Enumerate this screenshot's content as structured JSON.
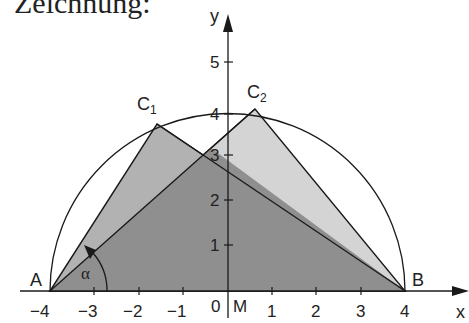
{
  "heading": "Zeichnung:",
  "colors": {
    "dark_fill": "#8c8c8c",
    "mid_fill": "#b4b4b4",
    "light_fill": "#d6d6d6",
    "line": "#1a1a1a",
    "background": "#ffffff"
  },
  "axes": {
    "x_label": "x",
    "y_label": "y",
    "x_ticks": [
      "−4",
      "−3",
      "−2",
      "−1",
      "0",
      "1",
      "2",
      "3",
      "4"
    ],
    "y_ticks": [
      "1",
      "2",
      "3",
      "4",
      "5"
    ],
    "origin_label": "0"
  },
  "points": {
    "A": {
      "label": "A",
      "x": -4,
      "y": 0
    },
    "B": {
      "label": "B",
      "x": 4,
      "y": 0
    },
    "M": {
      "label": "M",
      "x": 0,
      "y": 0
    },
    "C1": {
      "label": "C",
      "sub": "1",
      "x": -1.6,
      "y": 3.6
    },
    "C2": {
      "label": "C",
      "sub": "2",
      "x": 0.6,
      "y": 3.95
    }
  },
  "angle": {
    "label": "α"
  },
  "circle": {
    "center": "M",
    "radius": 4,
    "type": "semicircle"
  }
}
